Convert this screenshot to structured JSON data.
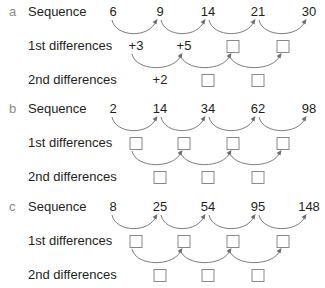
{
  "sections": [
    {
      "letter": "a",
      "sequence_label": "Sequence",
      "first_label": "1st differences",
      "second_label": "2nd differences",
      "sequence": [
        "6",
        "9",
        "14",
        "21",
        "30"
      ],
      "first_differences": [
        "+3",
        "+5",
        "",
        ""
      ],
      "second_differences": [
        "+2",
        "",
        ""
      ]
    },
    {
      "letter": "b",
      "sequence_label": "Sequence",
      "first_label": "1st differences",
      "second_label": "2nd differences",
      "sequence": [
        "2",
        "14",
        "34",
        "62",
        "98"
      ],
      "first_differences": [
        "",
        "",
        "",
        ""
      ],
      "second_differences": [
        "",
        "",
        ""
      ]
    },
    {
      "letter": "c",
      "sequence_label": "Sequence",
      "first_label": "1st differences",
      "second_label": "2nd differences",
      "sequence": [
        "8",
        "25",
        "54",
        "95",
        "148"
      ],
      "first_differences": [
        "",
        "",
        "",
        ""
      ],
      "second_differences": [
        "",
        "",
        ""
      ]
    }
  ],
  "colors": {
    "text": "#231f20",
    "letter": "#8a8a8a",
    "arrow": "#6d6e71",
    "box_border": "#8a8a8a"
  }
}
